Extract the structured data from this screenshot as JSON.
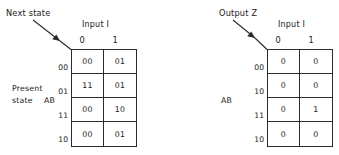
{
  "figure": {
    "background_color": "#ffffff",
    "line_color": "#2b2b2b",
    "text_color": "#1a1a1a"
  },
  "tables": [
    {
      "id": "next-state-table",
      "caption": "Next state",
      "column_group_title": "Input I",
      "column_headers": [
        "0",
        "1"
      ],
      "row_caption_line1": "Present",
      "row_caption_line2": "state",
      "row_caption_variable": "AB",
      "row_headers": [
        "00",
        "01",
        "11",
        "10"
      ],
      "rows": [
        [
          "00",
          "01"
        ],
        [
          "11",
          "01"
        ],
        [
          "00",
          "10"
        ],
        [
          "00",
          "01"
        ]
      ]
    },
    {
      "id": "output-table",
      "caption": "Output Z",
      "column_group_title": "Input I",
      "column_headers": [
        "0",
        "1"
      ],
      "row_caption_variable": "AB",
      "row_headers": [
        "00",
        "10",
        "11",
        "10"
      ],
      "rows": [
        [
          "0",
          "0"
        ],
        [
          "0",
          "0"
        ],
        [
          "0",
          "1"
        ],
        [
          "0",
          "0"
        ]
      ]
    }
  ]
}
